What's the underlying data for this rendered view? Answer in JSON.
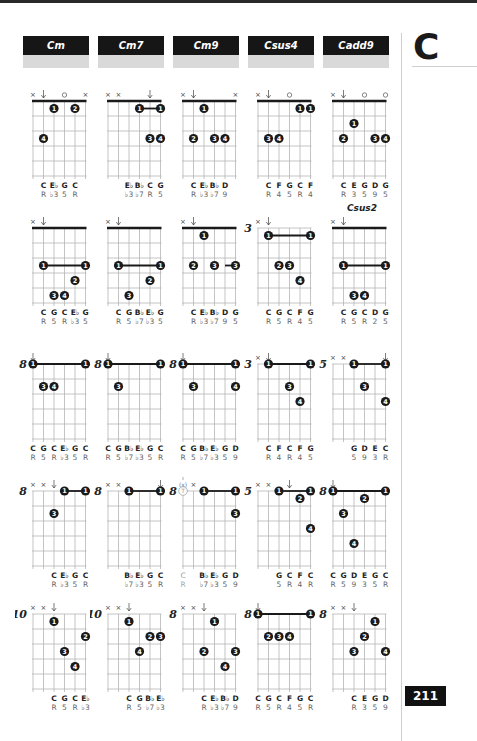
{
  "header": {
    "tabs": [
      {
        "label": "Cm"
      },
      {
        "label": "Cm7"
      },
      {
        "label": "Cm9"
      },
      {
        "label": "Csus4"
      },
      {
        "label": "Cadd9"
      }
    ]
  },
  "sidebar": {
    "letter": "C",
    "page_number": "211"
  },
  "extra_labels": [
    {
      "text": "Csus2",
      "col": 4,
      "row": 1
    }
  ],
  "diagrams": [
    {
      "row": 0,
      "col": 0,
      "fret": "",
      "marks": [
        "x",
        "d",
        "",
        "o",
        "",
        "x"
      ],
      "barre": null,
      "dots": [
        {
          "s": 2,
          "f": 1,
          "n": "1"
        },
        {
          "s": 4,
          "f": 1,
          "n": "2"
        },
        {
          "s": 1,
          "f": 3,
          "n": "4"
        }
      ],
      "notes": [
        "",
        "C",
        "E♭",
        "G",
        "C",
        ""
      ],
      "deg": [
        "",
        "R",
        "♭3",
        "5",
        "R",
        ""
      ]
    },
    {
      "row": 0,
      "col": 1,
      "fret": "",
      "marks": [
        "x",
        "x",
        "",
        "",
        "d",
        ""
      ],
      "barre": {
        "from": 3,
        "to": 5,
        "f": 1
      },
      "dots": [
        {
          "s": 3,
          "f": 1,
          "n": "1"
        },
        {
          "s": 5,
          "f": 1,
          "n": "1"
        },
        {
          "s": 4,
          "f": 3,
          "n": "3"
        },
        {
          "s": 5,
          "f": 3,
          "n": "4"
        }
      ],
      "notes": [
        "",
        "",
        "E♭",
        "B♭",
        "C",
        "G"
      ],
      "deg": [
        "",
        "",
        "♭3",
        "♭7",
        "R",
        "5"
      ]
    },
    {
      "row": 0,
      "col": 2,
      "fret": "",
      "marks": [
        "x",
        "d",
        "",
        "",
        "",
        "x"
      ],
      "barre": null,
      "dots": [
        {
          "s": 2,
          "f": 1,
          "n": "1"
        },
        {
          "s": 1,
          "f": 3,
          "n": "2"
        },
        {
          "s": 3,
          "f": 3,
          "n": "3"
        },
        {
          "s": 4,
          "f": 3,
          "n": "4"
        }
      ],
      "notes": [
        "",
        "C",
        "E♭",
        "B♭",
        "D",
        ""
      ],
      "deg": [
        "",
        "R",
        "♭3",
        "♭7",
        "9",
        ""
      ]
    },
    {
      "row": 0,
      "col": 3,
      "fret": "",
      "marks": [
        "x",
        "d",
        "",
        "o",
        "",
        ""
      ],
      "barre": null,
      "dots": [
        {
          "s": 4,
          "f": 1,
          "n": "1"
        },
        {
          "s": 5,
          "f": 1,
          "n": "1"
        },
        {
          "s": 1,
          "f": 3,
          "n": "3"
        },
        {
          "s": 2,
          "f": 3,
          "n": "4"
        }
      ],
      "notes": [
        "",
        "C",
        "F",
        "G",
        "C",
        "F"
      ],
      "deg": [
        "",
        "R",
        "4",
        "5",
        "R",
        "4"
      ]
    },
    {
      "row": 0,
      "col": 4,
      "fret": "",
      "marks": [
        "x",
        "d",
        "",
        "o",
        "",
        "o"
      ],
      "barre": null,
      "dots": [
        {
          "s": 2,
          "f": 2,
          "n": "1"
        },
        {
          "s": 1,
          "f": 3,
          "n": "2"
        },
        {
          "s": 4,
          "f": 3,
          "n": "3"
        },
        {
          "s": 5,
          "f": 3,
          "n": "4"
        }
      ],
      "notes": [
        "",
        "C",
        "E",
        "G",
        "D",
        "G"
      ],
      "deg": [
        "",
        "R",
        "3",
        "5",
        "9",
        "5"
      ]
    },
    {
      "row": 1,
      "col": 0,
      "fret": "",
      "marks": [
        "x",
        "d",
        "",
        "",
        "",
        ""
      ],
      "barre": {
        "from": 1,
        "to": 5,
        "f": 3
      },
      "dots": [
        {
          "s": 1,
          "f": 3,
          "n": "1"
        },
        {
          "s": 5,
          "f": 3,
          "n": "1"
        },
        {
          "s": 4,
          "f": 4,
          "n": "2"
        },
        {
          "s": 2,
          "f": 5,
          "n": "3"
        },
        {
          "s": 3,
          "f": 5,
          "n": "4"
        }
      ],
      "notes": [
        "",
        "C",
        "G",
        "C",
        "E♭",
        "G"
      ],
      "deg": [
        "",
        "R",
        "5",
        "R",
        "♭3",
        "5"
      ]
    },
    {
      "row": 1,
      "col": 1,
      "fret": "",
      "marks": [
        "x",
        "d",
        "",
        "",
        "",
        ""
      ],
      "barre": {
        "from": 1,
        "to": 5,
        "f": 3
      },
      "dots": [
        {
          "s": 1,
          "f": 3,
          "n": "1"
        },
        {
          "s": 5,
          "f": 3,
          "n": "1"
        },
        {
          "s": 4,
          "f": 4,
          "n": "2"
        },
        {
          "s": 2,
          "f": 5,
          "n": "3"
        }
      ],
      "notes": [
        "",
        "C",
        "G",
        "B♭",
        "E♭",
        "G"
      ],
      "deg": [
        "",
        "R",
        "5",
        "♭7",
        "♭3",
        "5"
      ]
    },
    {
      "row": 1,
      "col": 2,
      "fret": "",
      "marks": [
        "x",
        "d",
        "",
        "",
        "",
        ""
      ],
      "barre": {
        "from": 4,
        "to": 5,
        "f": 3
      },
      "dots": [
        {
          "s": 2,
          "f": 1,
          "n": "1"
        },
        {
          "s": 1,
          "f": 3,
          "n": "2"
        },
        {
          "s": 3,
          "f": 3,
          "n": "3"
        },
        {
          "s": 5,
          "f": 3,
          "n": "3"
        }
      ],
      "notes": [
        "",
        "C",
        "E♭",
        "B♭",
        "D",
        "G"
      ],
      "deg": [
        "",
        "R",
        "♭3",
        "♭7",
        "9",
        "5"
      ]
    },
    {
      "row": 1,
      "col": 3,
      "fret": "3",
      "marks": [
        "x",
        "d",
        "",
        "",
        "",
        ""
      ],
      "barre": {
        "from": 1,
        "to": 5,
        "f": 1
      },
      "dots": [
        {
          "s": 1,
          "f": 1,
          "n": "1"
        },
        {
          "s": 5,
          "f": 1,
          "n": "1"
        },
        {
          "s": 2,
          "f": 3,
          "n": "2"
        },
        {
          "s": 3,
          "f": 3,
          "n": "3"
        },
        {
          "s": 4,
          "f": 4,
          "n": "4"
        }
      ],
      "notes": [
        "",
        "C",
        "G",
        "C",
        "F",
        "G"
      ],
      "deg": [
        "",
        "R",
        "5",
        "R",
        "4",
        "5"
      ]
    },
    {
      "row": 1,
      "col": 4,
      "fret": "",
      "marks": [
        "x",
        "d",
        "",
        "",
        "",
        ""
      ],
      "barre": {
        "from": 1,
        "to": 5,
        "f": 3
      },
      "dots": [
        {
          "s": 1,
          "f": 3,
          "n": "1"
        },
        {
          "s": 5,
          "f": 3,
          "n": "1"
        },
        {
          "s": 2,
          "f": 5,
          "n": "3"
        },
        {
          "s": 3,
          "f": 5,
          "n": "4"
        }
      ],
      "notes": [
        "",
        "C",
        "G",
        "C",
        "D",
        "G"
      ],
      "deg": [
        "",
        "R",
        "5",
        "R",
        "2",
        "5"
      ]
    },
    {
      "row": 2,
      "col": 0,
      "fret": "8",
      "marks": [
        "d",
        "",
        "",
        "",
        "",
        ""
      ],
      "barre": {
        "from": 0,
        "to": 5,
        "f": 0
      },
      "dots": [
        {
          "s": 0,
          "f": 0,
          "n": "1"
        },
        {
          "s": 5,
          "f": 0,
          "n": "1"
        },
        {
          "s": 1,
          "f": 2,
          "n": "3"
        },
        {
          "s": 2,
          "f": 2,
          "n": "4"
        }
      ],
      "notes": [
        "C",
        "G",
        "C",
        "E♭",
        "G",
        "C"
      ],
      "deg": [
        "R",
        "5",
        "R",
        "♭3",
        "5",
        "R"
      ]
    },
    {
      "row": 2,
      "col": 1,
      "fret": "8",
      "marks": [
        "d",
        "",
        "",
        "",
        "",
        ""
      ],
      "barre": {
        "from": 0,
        "to": 5,
        "f": 0
      },
      "dots": [
        {
          "s": 0,
          "f": 0,
          "n": "1"
        },
        {
          "s": 5,
          "f": 0,
          "n": "1"
        },
        {
          "s": 1,
          "f": 2,
          "n": "3"
        }
      ],
      "notes": [
        "C",
        "G",
        "B♭",
        "E♭",
        "G",
        "C"
      ],
      "deg": [
        "R",
        "5",
        "♭7",
        "♭3",
        "5",
        "R"
      ]
    },
    {
      "row": 2,
      "col": 2,
      "fret": "8",
      "marks": [
        "d",
        "",
        "",
        "",
        "",
        ""
      ],
      "barre": {
        "from": 0,
        "to": 5,
        "f": 0
      },
      "dots": [
        {
          "s": 0,
          "f": 0,
          "n": "1"
        },
        {
          "s": 5,
          "f": 0,
          "n": "1"
        },
        {
          "s": 1,
          "f": 2,
          "n": "3"
        },
        {
          "s": 5,
          "f": 2,
          "n": "4"
        }
      ],
      "notes": [
        "C",
        "G",
        "B♭",
        "E♭",
        "G",
        "D"
      ],
      "deg": [
        "R",
        "5",
        "♭7",
        "♭3",
        "5",
        "9"
      ]
    },
    {
      "row": 2,
      "col": 3,
      "fret": "3",
      "marks": [
        "x",
        "d",
        "",
        "",
        "",
        ""
      ],
      "barre": {
        "from": 1,
        "to": 5,
        "f": 0
      },
      "dots": [
        {
          "s": 1,
          "f": 0,
          "n": "1"
        },
        {
          "s": 5,
          "f": 0,
          "n": "1"
        },
        {
          "s": 3,
          "f": 2,
          "n": "3"
        },
        {
          "s": 4,
          "f": 3,
          "n": "4"
        }
      ],
      "notes": [
        "",
        "C",
        "F",
        "C",
        "F",
        "G"
      ],
      "deg": [
        "",
        "R",
        "4",
        "R",
        "4",
        "5"
      ]
    },
    {
      "row": 2,
      "col": 4,
      "fret": "5",
      "marks": [
        "x",
        "x",
        "",
        "",
        "",
        "d"
      ],
      "barre": {
        "from": 2,
        "to": 5,
        "f": 0
      },
      "dots": [
        {
          "s": 2,
          "f": 0,
          "n": "1"
        },
        {
          "s": 5,
          "f": 0,
          "n": "1"
        },
        {
          "s": 3,
          "f": 2,
          "n": "3"
        },
        {
          "s": 5,
          "f": 3,
          "n": "4"
        }
      ],
      "notes": [
        "",
        "",
        "G",
        "D",
        "E",
        "C"
      ],
      "deg": [
        "",
        "",
        "5",
        "9",
        "3",
        "R"
      ]
    },
    {
      "row": 3,
      "col": 0,
      "fret": "8",
      "marks": [
        "x",
        "x",
        "d",
        "",
        "",
        ""
      ],
      "barre": {
        "from": 3,
        "to": 5,
        "f": 0
      },
      "dots": [
        {
          "s": 3,
          "f": 0,
          "n": "1"
        },
        {
          "s": 5,
          "f": 0,
          "n": "1"
        },
        {
          "s": 2,
          "f": 2,
          "n": "3"
        }
      ],
      "notes": [
        "",
        "",
        "C",
        "E♭",
        "G",
        "C"
      ],
      "deg": [
        "",
        "",
        "R",
        "♭3",
        "5",
        "R"
      ]
    },
    {
      "row": 3,
      "col": 1,
      "fret": "8",
      "marks": [
        "x",
        "x",
        "",
        "",
        "",
        "d"
      ],
      "barre": {
        "from": 2,
        "to": 5,
        "f": 0
      },
      "dots": [
        {
          "s": 2,
          "f": 0,
          "n": "1"
        },
        {
          "s": 5,
          "f": 0,
          "n": "1"
        }
      ],
      "notes": [
        "",
        "",
        "B♭",
        "E♭",
        "G",
        "C"
      ],
      "deg": [
        "",
        "",
        "♭7",
        "♭3",
        "5",
        "R"
      ]
    },
    {
      "row": 3,
      "col": 2,
      "fret": "8",
      "marks": [
        "tx",
        "x",
        "",
        "",
        "",
        ""
      ],
      "thumb": true,
      "barre": {
        "from": 2,
        "to": 5,
        "f": 0
      },
      "dots": [
        {
          "s": 2,
          "f": 0,
          "n": "1"
        },
        {
          "s": 5,
          "f": 0,
          "n": "1"
        },
        {
          "s": 5,
          "f": 2,
          "n": "3"
        }
      ],
      "notes": [
        "C",
        "",
        "B♭",
        "E♭",
        "G",
        "D"
      ],
      "deg": [
        "R",
        "",
        "♭7",
        "♭3",
        "5",
        "9"
      ]
    },
    {
      "row": 3,
      "col": 3,
      "fret": "5",
      "marks": [
        "x",
        "x",
        "",
        "d",
        "",
        ""
      ],
      "barre": {
        "from": 2,
        "to": 5,
        "f": 0
      },
      "dots": [
        {
          "s": 2,
          "f": 0,
          "n": "1"
        },
        {
          "s": 5,
          "f": 0,
          "n": "1"
        },
        {
          "s": 4,
          "f": 1,
          "n": "2"
        },
        {
          "s": 5,
          "f": 3,
          "n": "4"
        }
      ],
      "notes": [
        "",
        "",
        "G",
        "C",
        "F",
        "C"
      ],
      "deg": [
        "",
        "",
        "5",
        "R",
        "4",
        "R"
      ]
    },
    {
      "row": 3,
      "col": 4,
      "fret": "8",
      "marks": [
        "d",
        "",
        "",
        "",
        "",
        ""
      ],
      "barre": {
        "from": 0,
        "to": 5,
        "f": 0
      },
      "dots": [
        {
          "s": 0,
          "f": 0,
          "n": "1"
        },
        {
          "s": 5,
          "f": 0,
          "n": "1"
        },
        {
          "s": 3,
          "f": 1,
          "n": "2"
        },
        {
          "s": 1,
          "f": 2,
          "n": "3"
        },
        {
          "s": 2,
          "f": 4,
          "n": "4"
        }
      ],
      "notes": [
        "C",
        "G",
        "D",
        "E",
        "G",
        "C"
      ],
      "deg": [
        "R",
        "5",
        "9",
        "3",
        "5",
        "R"
      ]
    },
    {
      "row": 4,
      "col": 0,
      "fret": "10",
      "marks": [
        "x",
        "x",
        "d",
        "",
        "",
        ""
      ],
      "barre": null,
      "dots": [
        {
          "s": 2,
          "f": 1,
          "n": "1"
        },
        {
          "s": 5,
          "f": 2,
          "n": "2"
        },
        {
          "s": 3,
          "f": 3,
          "n": "3"
        },
        {
          "s": 4,
          "f": 4,
          "n": "4"
        }
      ],
      "notes": [
        "",
        "",
        "C",
        "G",
        "C",
        "E♭"
      ],
      "deg": [
        "",
        "",
        "R",
        "5",
        "R",
        "♭3"
      ]
    },
    {
      "row": 4,
      "col": 1,
      "fret": "10",
      "marks": [
        "x",
        "x",
        "d",
        "",
        "",
        ""
      ],
      "barre": null,
      "dots": [
        {
          "s": 2,
          "f": 1,
          "n": "1"
        },
        {
          "s": 4,
          "f": 2,
          "n": "2"
        },
        {
          "s": 5,
          "f": 2,
          "n": "3"
        },
        {
          "s": 3,
          "f": 3,
          "n": "4"
        }
      ],
      "notes": [
        "",
        "",
        "C",
        "G",
        "B♭",
        "E♭"
      ],
      "deg": [
        "",
        "",
        "R",
        "5",
        "♭7",
        "♭3"
      ]
    },
    {
      "row": 4,
      "col": 2,
      "fret": "8",
      "marks": [
        "x",
        "x",
        "d",
        "",
        "",
        ""
      ],
      "barre": null,
      "dots": [
        {
          "s": 3,
          "f": 1,
          "n": "1"
        },
        {
          "s": 2,
          "f": 3,
          "n": "2"
        },
        {
          "s": 5,
          "f": 3,
          "n": "3"
        },
        {
          "s": 4,
          "f": 4,
          "n": "4"
        }
      ],
      "notes": [
        "",
        "",
        "C",
        "E♭",
        "B♭",
        "D"
      ],
      "deg": [
        "",
        "",
        "R",
        "♭3",
        "♭7",
        "9"
      ]
    },
    {
      "row": 4,
      "col": 3,
      "fret": "8",
      "marks": [
        "d",
        "",
        "",
        "",
        "",
        ""
      ],
      "barre": {
        "from": 0,
        "to": 5,
        "f": 0
      },
      "dots": [
        {
          "s": 0,
          "f": 0,
          "n": "1"
        },
        {
          "s": 5,
          "f": 0,
          "n": "1"
        },
        {
          "s": 1,
          "f": 2,
          "n": "2"
        },
        {
          "s": 2,
          "f": 2,
          "n": "3"
        },
        {
          "s": 3,
          "f": 2,
          "n": "4"
        }
      ],
      "notes": [
        "C",
        "G",
        "C",
        "F",
        "G",
        "C"
      ],
      "deg": [
        "R",
        "5",
        "R",
        "4",
        "5",
        "R"
      ]
    },
    {
      "row": 4,
      "col": 4,
      "fret": "8",
      "marks": [
        "x",
        "x",
        "d",
        "",
        "",
        ""
      ],
      "barre": null,
      "dots": [
        {
          "s": 4,
          "f": 1,
          "n": "1"
        },
        {
          "s": 3,
          "f": 2,
          "n": "2"
        },
        {
          "s": 2,
          "f": 3,
          "n": "3"
        },
        {
          "s": 5,
          "f": 3,
          "n": "4"
        }
      ],
      "notes": [
        "",
        "",
        "C",
        "E",
        "G",
        "D"
      ],
      "deg": [
        "",
        "",
        "R",
        "3",
        "5",
        "9"
      ]
    }
  ],
  "layout": {
    "col_x": [
      33,
      108,
      183,
      258,
      333
    ],
    "row_y": [
      101,
      228,
      364,
      491,
      614
    ],
    "tab_x": [
      23,
      98,
      173,
      248,
      323
    ]
  }
}
